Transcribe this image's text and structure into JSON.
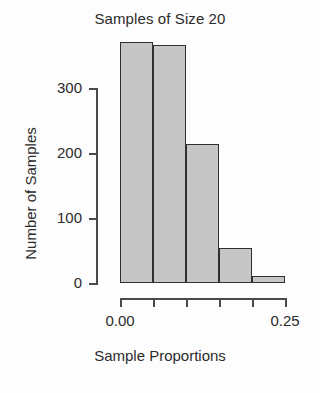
{
  "chart_data": {
    "type": "bar",
    "title": "Samples of Size 20",
    "xlabel": "Sample Proportions",
    "ylabel": "Number of Samples",
    "subtitle": "",
    "grid": false,
    "legend": "none",
    "bin_edges": [
      0.0,
      0.05,
      0.1,
      0.15,
      0.2,
      0.25
    ],
    "categories": [
      "0.00-0.05",
      "0.05-0.10",
      "0.10-0.15",
      "0.15-0.20",
      "0.20-0.25"
    ],
    "values": [
      371,
      366,
      214,
      54,
      11
    ],
    "xlim": [
      0.0,
      0.25
    ],
    "ylim": [
      0,
      300
    ],
    "xticks": [
      0.0,
      0.05,
      0.1,
      0.15,
      0.2,
      0.25
    ],
    "xtick_labels": [
      "0.00",
      "",
      "",
      "",
      "",
      "0.25"
    ],
    "yticks": [
      0,
      100,
      200,
      300
    ],
    "ytick_labels": [
      "0",
      "100",
      "200",
      "300"
    ],
    "bar_fill_color": "#c6c6c6",
    "bar_edge_color": "#303030",
    "axis_color": "#4a4a4a",
    "background_color": "#fdfdfd"
  }
}
